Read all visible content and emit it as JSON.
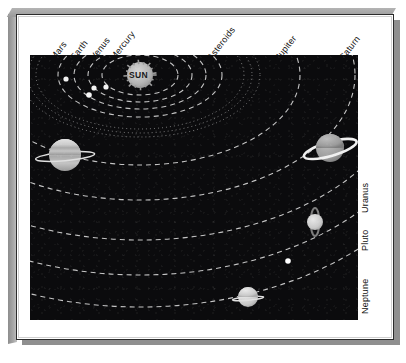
{
  "figure": {
    "sun_label": "SUN",
    "background_color": "#0b0b0d",
    "orbit_color": "#d8d8d8",
    "planet_color": "#c9c9c9",
    "frame_color": "#8f8f8f"
  },
  "top_labels": [
    {
      "text": "Mars",
      "x": 56,
      "y": 52
    },
    {
      "text": "Earth",
      "x": 76,
      "y": 52
    },
    {
      "text": "Venus",
      "x": 96,
      "y": 52
    },
    {
      "text": "Mercury",
      "x": 116,
      "y": 52
    },
    {
      "text": "Asteroids",
      "x": 213,
      "y": 52
    },
    {
      "text": "Jupiter",
      "x": 281,
      "y": 52
    },
    {
      "text": "Saturn",
      "x": 345,
      "y": 52
    }
  ],
  "right_labels": [
    {
      "text": "Uranus",
      "x": 370,
      "y": 203
    },
    {
      "text": "Pluto",
      "x": 370,
      "y": 241
    },
    {
      "text": "Neptune",
      "x": 370,
      "y": 304
    }
  ],
  "chart_data": {
    "type": "diagram",
    "subtype": "orbital-schematic",
    "center_body": {
      "name": "SUN",
      "cx": 110,
      "cy": 20,
      "r": 13,
      "color": "#b9b9b9",
      "label": "SUN"
    },
    "orbits": [
      {
        "name": "Mercury",
        "rx": 38,
        "ry": 20,
        "style": "dashed"
      },
      {
        "name": "Venus",
        "rx": 52,
        "ry": 27,
        "style": "dashed"
      },
      {
        "name": "Earth",
        "rx": 66,
        "ry": 34,
        "style": "dashed"
      },
      {
        "name": "Mars",
        "rx": 82,
        "ry": 42,
        "style": "dashed"
      },
      {
        "name": "Asteroids",
        "rx": 104,
        "ry": 54,
        "style": "dotted"
      },
      {
        "name": "Asteroids2",
        "rx": 112,
        "ry": 58,
        "style": "dotted"
      },
      {
        "name": "Asteroids3",
        "rx": 120,
        "ry": 62,
        "style": "dotted"
      },
      {
        "name": "Jupiter",
        "rx": 160,
        "ry": 90,
        "style": "dashed"
      },
      {
        "name": "Saturn",
        "rx": 215,
        "ry": 125,
        "style": "dashed"
      },
      {
        "name": "Uranus",
        "rx": 268,
        "ry": 165,
        "style": "dashed"
      },
      {
        "name": "Pluto",
        "rx": 300,
        "ry": 200,
        "style": "dashed"
      },
      {
        "name": "Neptune",
        "rx": 330,
        "ry": 232,
        "style": "dashed"
      }
    ],
    "planets": [
      {
        "name": "Mars",
        "cx": 36,
        "cy": 24,
        "r": 2.6,
        "ring": false,
        "color": "#f2f2f2"
      },
      {
        "name": "Earth",
        "cx": 64,
        "cy": 33,
        "r": 2.6,
        "ring": false,
        "color": "#f2f2f2"
      },
      {
        "name": "Venus",
        "cx": 76,
        "cy": 32,
        "r": 2.6,
        "ring": false,
        "color": "#f2f2f2"
      },
      {
        "name": "Mercury",
        "cx": 59,
        "cy": 40,
        "r": 2.8,
        "ring": false,
        "color": "#f7f7f7"
      },
      {
        "name": "Jupiter",
        "cx": 35,
        "cy": 100,
        "r": 16,
        "ring": true,
        "color": "#cfcfcf"
      },
      {
        "name": "Saturn",
        "cx": 300,
        "cy": 93,
        "r": 14,
        "ring": true,
        "color": "#a6a6a6"
      },
      {
        "name": "Uranus",
        "cx": 285,
        "cy": 167,
        "r": 8,
        "ring": true,
        "color": "#d2d2d2"
      },
      {
        "name": "Pluto",
        "cx": 258,
        "cy": 206,
        "r": 2.8,
        "ring": false,
        "color": "#ffffff"
      },
      {
        "name": "Neptune",
        "cx": 218,
        "cy": 242,
        "r": 10,
        "ring": true,
        "color": "#c4c4c4"
      }
    ],
    "legend_top": [
      "Mars",
      "Earth",
      "Venus",
      "Mercury",
      "Asteroids",
      "Jupiter",
      "Saturn"
    ],
    "legend_right": [
      "Uranus",
      "Pluto",
      "Neptune"
    ]
  }
}
